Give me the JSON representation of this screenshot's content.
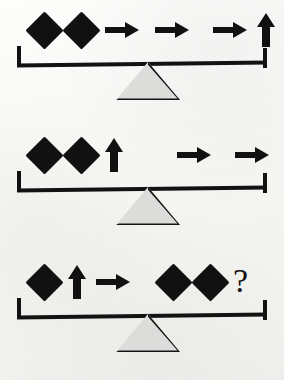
{
  "puzzle": {
    "title": "Balance Scale Logic Puzzle",
    "background_color": "#fbfbfa",
    "symbol_color": "#111111",
    "fulcrum_color": "#dcdcda",
    "question_mark": "?",
    "rows": [
      {
        "id": "scale-1",
        "state": "balanced",
        "left": {
          "symbols": [
            "diamond",
            "diamond",
            "arrow-right"
          ],
          "counts": {
            "diamond": 2,
            "arrow-right": 1,
            "arrow-up": 0
          }
        },
        "right": {
          "symbols": [
            "arrow-right",
            "arrow-right",
            "arrow-up"
          ],
          "counts": {
            "diamond": 0,
            "arrow-right": 2,
            "arrow-up": 1
          }
        }
      },
      {
        "id": "scale-2",
        "state": "balanced",
        "left": {
          "symbols": [
            "diamond",
            "diamond",
            "arrow-up"
          ],
          "counts": {
            "diamond": 2,
            "arrow-right": 0,
            "arrow-up": 1
          }
        },
        "right": {
          "symbols": [
            "arrow-right",
            "arrow-right"
          ],
          "counts": {
            "diamond": 0,
            "arrow-right": 2,
            "arrow-up": 0
          }
        }
      },
      {
        "id": "scale-3",
        "state": "balanced",
        "left": {
          "symbols": [
            "diamond",
            "arrow-up",
            "arrow-right"
          ],
          "counts": {
            "diamond": 1,
            "arrow-right": 1,
            "arrow-up": 1
          }
        },
        "right": {
          "symbols": [
            "diamond",
            "diamond",
            "question"
          ],
          "counts": {
            "diamond": 2,
            "arrow-right": 0,
            "arrow-up": 0
          },
          "unknown": "?"
        }
      }
    ]
  }
}
